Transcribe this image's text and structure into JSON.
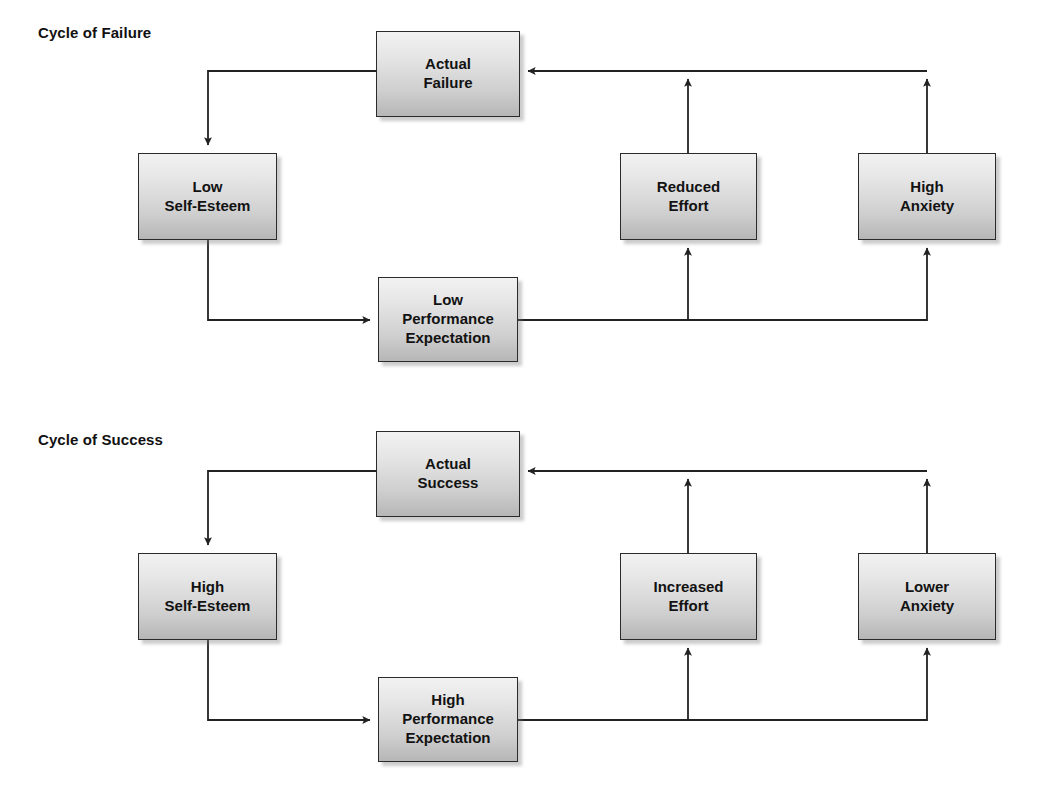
{
  "diagram": {
    "title_failure": "Cycle of Failure",
    "title_success": "Cycle of Success",
    "line_color": "#222222",
    "node_border_color": "#2b2b2b",
    "node_fill_top": "#f2f2f2",
    "node_fill_bottom": "#b6b6b6",
    "background": "#ffffff"
  },
  "cycles": [
    {
      "id": "cycle-of-failure",
      "title": "Cycle of Failure",
      "nodes": [
        {
          "id": "actual-failure",
          "label": "Actual\nFailure",
          "x": 376,
          "y": 31,
          "w": 144,
          "h": 86
        },
        {
          "id": "low-self-esteem",
          "label": "Low\nSelf-Esteem",
          "x": 138,
          "y": 153,
          "w": 139,
          "h": 87
        },
        {
          "id": "reduced-effort",
          "label": "Reduced\nEffort",
          "x": 620,
          "y": 153,
          "w": 137,
          "h": 87
        },
        {
          "id": "high-anxiety",
          "label": "High\nAnxiety",
          "x": 858,
          "y": 153,
          "w": 138,
          "h": 87
        },
        {
          "id": "low-performance-expectation",
          "label": "Low\nPerformance\nExpectation",
          "x": 378,
          "y": 277,
          "w": 140,
          "h": 85
        }
      ],
      "edges": [
        {
          "id": "actual-failure-to-low-self-esteem",
          "from": "actual-failure",
          "to": "low-self-esteem"
        },
        {
          "id": "low-self-esteem-to-low-performance",
          "from": "low-self-esteem",
          "to": "low-performance-expectation"
        },
        {
          "id": "low-performance-to-reduced-effort",
          "from": "low-performance-expectation",
          "to": "reduced-effort"
        },
        {
          "id": "low-performance-to-high-anxiety",
          "from": "low-performance-expectation",
          "to": "high-anxiety"
        },
        {
          "id": "reduced-effort-to-actual-failure",
          "from": "reduced-effort",
          "to": "actual-failure"
        },
        {
          "id": "high-anxiety-to-actual-failure",
          "from": "high-anxiety",
          "to": "actual-failure"
        }
      ]
    },
    {
      "id": "cycle-of-success",
      "title": "Cycle of Success",
      "nodes": [
        {
          "id": "actual-success",
          "label": "Actual\nSuccess",
          "x": 376,
          "y": 431,
          "w": 144,
          "h": 86
        },
        {
          "id": "high-self-esteem",
          "label": "High\nSelf-Esteem",
          "x": 138,
          "y": 553,
          "w": 139,
          "h": 87
        },
        {
          "id": "increased-effort",
          "label": "Increased\nEffort",
          "x": 620,
          "y": 553,
          "w": 137,
          "h": 87
        },
        {
          "id": "lower-anxiety",
          "label": "Lower\nAnxiety",
          "x": 858,
          "y": 553,
          "w": 138,
          "h": 87
        },
        {
          "id": "high-performance-expectation",
          "label": "High\nPerformance\nExpectation",
          "x": 378,
          "y": 677,
          "w": 140,
          "h": 85
        }
      ],
      "edges": [
        {
          "id": "actual-success-to-high-self-esteem",
          "from": "actual-success",
          "to": "high-self-esteem"
        },
        {
          "id": "high-self-esteem-to-high-performance",
          "from": "high-self-esteem",
          "to": "high-performance-expectation"
        },
        {
          "id": "high-performance-to-increased-effort",
          "from": "high-performance-expectation",
          "to": "increased-effort"
        },
        {
          "id": "high-performance-to-lower-anxiety",
          "from": "high-performance-expectation",
          "to": "lower-anxiety"
        },
        {
          "id": "increased-effort-to-actual-success",
          "from": "increased-effort",
          "to": "actual-success"
        },
        {
          "id": "lower-anxiety-to-actual-success",
          "from": "lower-anxiety",
          "to": "actual-success"
        }
      ]
    }
  ],
  "titles": [
    {
      "id": "title-cycle-of-failure",
      "text": "Cycle of Failure",
      "x": 38,
      "y": 24
    },
    {
      "id": "title-cycle-of-success",
      "text": "Cycle of Success",
      "x": 38,
      "y": 431
    }
  ]
}
